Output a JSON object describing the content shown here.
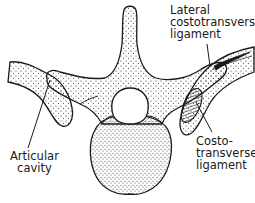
{
  "diagram": {
    "style": "stippled line drawing",
    "colors": {
      "ink": "#1a1a1a",
      "background": "#ffffff",
      "stipple": "#333333"
    },
    "labels": {
      "lateral_costotransverse": {
        "lines": [
          "Lateral",
          "costotransverse",
          "ligament"
        ]
      },
      "articular_cavity": {
        "lines": [
          "Articular",
          "cavity"
        ]
      },
      "costotransverse": {
        "lines": [
          "Costo-",
          "transverse",
          "ligament"
        ]
      }
    },
    "structures": [
      "spinous process",
      "vertebral body",
      "vertebral foramen",
      "left transverse process",
      "right transverse process",
      "left rib",
      "right rib",
      "costotransverse ligament (hatched)",
      "lateral costotransverse ligament"
    ]
  }
}
